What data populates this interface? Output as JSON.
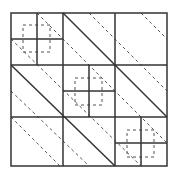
{
  "diagram": {
    "stroke_color": "#333333",
    "dash_color": "#555555",
    "outer_box": {
      "x": 11,
      "y": 13,
      "w": 156,
      "h": 153
    },
    "grid_x": [
      63,
      115
    ],
    "grid_y": [
      65,
      117
    ],
    "solid_lines": [
      [
        37,
        13,
        37,
        65
      ],
      [
        11,
        39,
        63,
        39
      ],
      [
        89,
        65,
        89,
        117
      ],
      [
        63,
        91,
        115,
        91
      ],
      [
        141,
        117,
        141,
        166
      ],
      [
        115,
        143,
        167,
        143
      ],
      [
        63,
        13,
        167,
        117
      ],
      [
        11,
        65,
        115,
        166
      ]
    ],
    "dashed_lines": [
      [
        37,
        13,
        167,
        143
      ],
      [
        11,
        91,
        89,
        166
      ],
      [
        89,
        13,
        167,
        91
      ],
      [
        11,
        117,
        60,
        166
      ],
      [
        11,
        39,
        141,
        166
      ],
      [
        141,
        13,
        167,
        39
      ]
    ],
    "dashed_squares": [
      {
        "x": 23,
        "y": 25,
        "w": 27,
        "h": 27
      },
      {
        "x": 75,
        "y": 78,
        "w": 27,
        "h": 27
      },
      {
        "x": 127,
        "y": 130,
        "w": 27,
        "h": 27
      }
    ]
  }
}
